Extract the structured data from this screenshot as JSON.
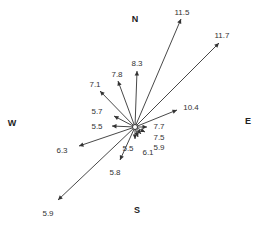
{
  "diagram": {
    "type": "wind-rose-vector",
    "center": [
      135,
      127
    ],
    "line_color": "#333333",
    "cardinals": [
      {
        "label": "N",
        "x": 135,
        "y": 22
      },
      {
        "label": "E",
        "x": 248,
        "y": 124
      },
      {
        "label": "W",
        "x": 12,
        "y": 126
      },
      {
        "label": "S",
        "x": 137,
        "y": 213
      }
    ],
    "vectors": [
      {
        "value": "11.5",
        "tip": [
          181,
          19
        ],
        "label_pos": [
          182,
          15
        ]
      },
      {
        "value": "11.7",
        "tip": [
          219,
          43
        ],
        "label_pos": [
          222,
          38
        ]
      },
      {
        "value": "8.3",
        "tip": [
          137,
          71
        ],
        "label_pos": [
          137,
          66
        ]
      },
      {
        "value": "7.8",
        "tip": [
          118,
          81
        ],
        "label_pos": [
          117,
          77
        ]
      },
      {
        "value": "7.1",
        "tip": [
          100,
          91
        ],
        "label_pos": [
          95,
          87
        ]
      },
      {
        "value": "5.7",
        "tip": [
          114,
          116
        ],
        "label_pos": [
          97,
          114
        ]
      },
      {
        "value": "5.5",
        "tip": [
          112,
          126
        ],
        "label_pos": [
          97,
          129
        ]
      },
      {
        "value": "10.4",
        "tip": [
          177,
          110
        ],
        "label_pos": [
          191,
          110
        ]
      },
      {
        "value": "7.7",
        "tip": [
          147,
          127
        ],
        "label_pos": [
          159,
          129
        ]
      },
      {
        "value": "7.5",
        "tip": [
          145,
          132
        ],
        "label_pos": [
          159,
          140
        ]
      },
      {
        "value": "5.9",
        "tip": [
          141,
          134
        ],
        "label_pos": [
          159,
          150
        ]
      },
      {
        "value": "6.1",
        "tip": [
          138,
          137
        ],
        "label_pos": [
          148,
          155
        ]
      },
      {
        "value": "5.5",
        "tip": [
          135,
          139
        ],
        "label_pos": [
          128,
          151
        ]
      },
      {
        "value": "5.8",
        "tip": [
          120,
          160
        ],
        "label_pos": [
          115,
          175
        ]
      },
      {
        "value": "6.3",
        "tip": [
          79,
          146
        ],
        "label_pos": [
          62,
          153
        ]
      },
      {
        "value": "5.9",
        "tip": [
          58,
          200
        ],
        "label_pos": [
          48,
          216
        ]
      }
    ]
  }
}
